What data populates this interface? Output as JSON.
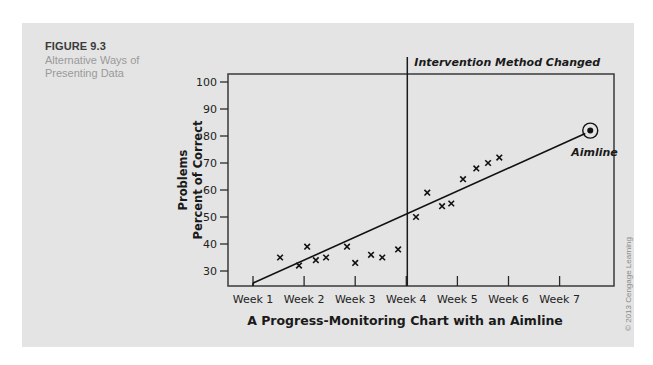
{
  "figure": {
    "label": "FIGURE 9.3",
    "caption": "Alternative Ways of Presenting Data",
    "copyright": "© 2013 Cengage Learning"
  },
  "chart_data": {
    "type": "scatter",
    "title": "A Progress-Monitoring Chart with an Aimline",
    "xlabel": "A Progress-Monitoring Chart with an Aimline",
    "ylabel_line1": "Problems",
    "ylabel_line2": "Percent of Correct",
    "ylabel": "Percent of Correct Problems",
    "x_ticks": [
      "Week 1",
      "Week 2",
      "Week 3",
      "Week 4",
      "Week 5",
      "Week 6",
      "Week 7"
    ],
    "y_ticks": [
      30,
      40,
      50,
      60,
      70,
      80,
      90,
      100
    ],
    "ylim": [
      25,
      102
    ],
    "xlim": [
      0.5,
      8.2
    ],
    "grid": false,
    "marker": "x",
    "points": [
      {
        "x": 1.53,
        "y": 35
      },
      {
        "x": 1.9,
        "y": 32
      },
      {
        "x": 2.06,
        "y": 39
      },
      {
        "x": 2.23,
        "y": 34
      },
      {
        "x": 2.43,
        "y": 35
      },
      {
        "x": 2.84,
        "y": 39
      },
      {
        "x": 3.0,
        "y": 33
      },
      {
        "x": 3.31,
        "y": 36
      },
      {
        "x": 3.53,
        "y": 35
      },
      {
        "x": 3.84,
        "y": 38
      },
      {
        "x": 4.19,
        "y": 50
      },
      {
        "x": 4.41,
        "y": 59
      },
      {
        "x": 4.7,
        "y": 54
      },
      {
        "x": 4.88,
        "y": 55
      },
      {
        "x": 5.11,
        "y": 64
      },
      {
        "x": 5.37,
        "y": 68
      },
      {
        "x": 5.6,
        "y": 70
      },
      {
        "x": 5.82,
        "y": 72
      }
    ],
    "aimline": {
      "label": "Aimline",
      "start": {
        "x": 1.0,
        "y": 27
      },
      "end": {
        "x": 7.6,
        "y": 82
      },
      "goal_marker": "circled-dot"
    },
    "annotations": [
      {
        "text": "Intervention Method Changed",
        "x": 4.0,
        "type": "vertical-line"
      }
    ]
  }
}
